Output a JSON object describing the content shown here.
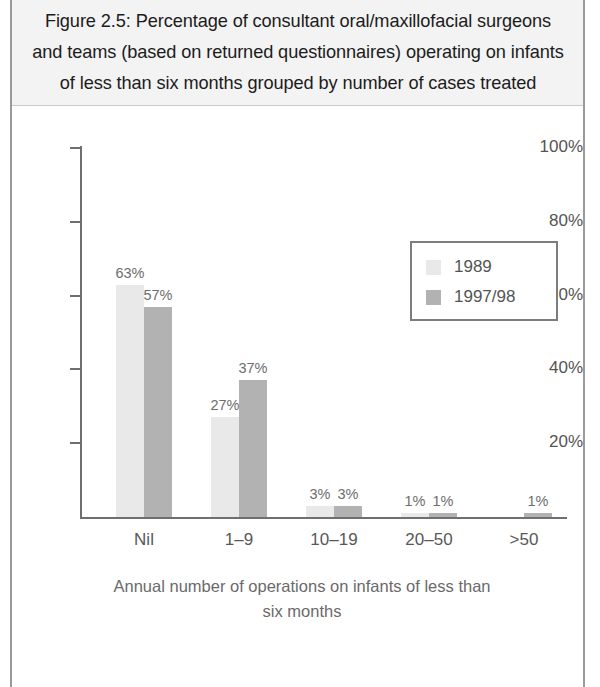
{
  "figure": {
    "caption": "Figure 2.5: Percentage of consultant oral/maxillofacial surgeons and teams (based on returned questionnaires) operating on infants of less than six months grouped by number of cases treated"
  },
  "legend": {
    "position": "inside-top-right",
    "entries": [
      {
        "label": "1989",
        "color": "#e9e9e9"
      },
      {
        "label": "1997/98",
        "color": "#b2b2b2"
      }
    ]
  },
  "axes": {
    "y_ticks": [
      "100%",
      "80%",
      "60%",
      "40%",
      "20%"
    ],
    "y_tick_values": [
      100,
      80,
      60,
      40,
      20
    ],
    "x_title_line1": "Annual number of operations on infants of less than",
    "x_title_line2": "six months"
  },
  "chart_data": {
    "type": "bar",
    "title": "Figure 2.5: Percentage of consultant oral/maxillofacial surgeons and teams (based on returned questionnaires) operating on infants of less than six months grouped by number of cases treated",
    "xlabel": "Annual number of operations on infants of less than six months",
    "ylabel": "",
    "ylim": [
      0,
      100
    ],
    "yticks": [
      20,
      40,
      60,
      80,
      100
    ],
    "ytick_labels": [
      "20%",
      "40%",
      "60%",
      "80%",
      "100%"
    ],
    "grid": false,
    "legend_position": "upper right",
    "categories": [
      "Nil",
      "1–9",
      "10–19",
      "20–50",
      ">50"
    ],
    "series": [
      {
        "name": "1989",
        "color": "#e9e9e9",
        "values": [
          63,
          27,
          3,
          1,
          null
        ],
        "data_labels": [
          "63%",
          "27%",
          "3%",
          "1%",
          ""
        ]
      },
      {
        "name": "1997/98",
        "color": "#b2b2b2",
        "values": [
          57,
          37,
          3,
          1,
          1
        ],
        "data_labels": [
          "57%",
          "37%",
          "3%",
          "1%",
          "1%"
        ]
      }
    ]
  }
}
